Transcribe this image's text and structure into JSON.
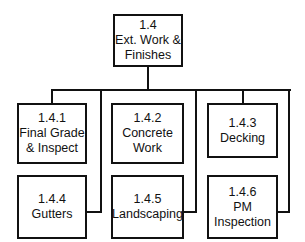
{
  "root": {
    "id": "1.4",
    "lines": [
      "Ext. Work &",
      "Finishes"
    ]
  },
  "children": [
    {
      "id": "1.4.1",
      "lines": [
        "Final Grade",
        "& Inspect"
      ]
    },
    {
      "id": "1.4.2",
      "lines": [
        "Concrete",
        "Work"
      ]
    },
    {
      "id": "1.4.3",
      "lines": [
        "Decking"
      ]
    },
    {
      "id": "1.4.4",
      "lines": [
        "Gutters"
      ]
    },
    {
      "id": "1.4.5",
      "lines": [
        "Landscaping"
      ]
    },
    {
      "id": "1.4.6",
      "lines": [
        "PM",
        "Inspection"
      ]
    }
  ]
}
